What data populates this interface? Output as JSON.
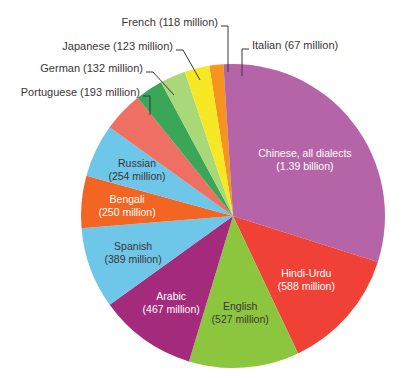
{
  "chart_data": {
    "type": "pie",
    "title": "",
    "subtitle": "",
    "xlabel": "",
    "ylabel": "",
    "legend_position": "none",
    "grid": false,
    "unit": "millions of speakers",
    "categories": [
      "Chinese, all dialects",
      "Hindi-Urdu",
      "English",
      "Arabic",
      "Spanish",
      "Bengali",
      "Russian",
      "Portuguese",
      "German",
      "Japanese",
      "French",
      "Italian"
    ],
    "values": [
      1390,
      588,
      527,
      467,
      389,
      250,
      254,
      193,
      132,
      123,
      118,
      67
    ],
    "value_labels": [
      "(1.39 billion)",
      "(588 million)",
      "(527 million)",
      "(467 million)",
      "(389 million)",
      "(250 million)",
      "(254 million)",
      "(193 million)",
      "(132 million)",
      "(123 million)",
      "(118 million)",
      "(67 million)"
    ],
    "colors": [
      "#b565a7",
      "#ef4136",
      "#8cc63f",
      "#a42a7b",
      "#6ec6e8",
      "#f26522",
      "#6ec6e8",
      "#ef6f63",
      "#3aa657",
      "#a8d878",
      "#f7e825",
      "#f7941e"
    ]
  },
  "slices": [
    {
      "name": "Chinese, all dialects",
      "value": 1390,
      "label_line1": "Chinese, all dialects",
      "label_line2": "(1.39 billion)",
      "color": "#b565a7",
      "label_placement": "inside",
      "label_color": "light"
    },
    {
      "name": "Hindi-Urdu",
      "value": 588,
      "label_line1": "Hindi-Urdu",
      "label_line2": "(588 million)",
      "color": "#ef4136",
      "label_placement": "inside",
      "label_color": "light"
    },
    {
      "name": "English",
      "value": 527,
      "label_line1": "English",
      "label_line2": "(527 million)",
      "color": "#8cc63f",
      "label_placement": "inside",
      "label_color": "dark"
    },
    {
      "name": "Arabic",
      "value": 467,
      "label_line1": "Arabic",
      "label_line2": "(467 million)",
      "color": "#a42a7b",
      "label_placement": "inside",
      "label_color": "light"
    },
    {
      "name": "Spanish",
      "value": 389,
      "label_line1": "Spanish",
      "label_line2": "(389 million)",
      "color": "#6ec6e8",
      "label_placement": "inside",
      "label_color": "dark"
    },
    {
      "name": "Bengali",
      "value": 250,
      "label_line1": "Bengali",
      "label_line2": "(250 million)",
      "color": "#f26522",
      "label_placement": "inside",
      "label_color": "light"
    },
    {
      "name": "Russian",
      "value": 254,
      "label_line1": "Russian",
      "label_line2": "(254 million)",
      "color": "#6ec6e8",
      "label_placement": "inside",
      "label_color": "dark"
    },
    {
      "name": "Portuguese",
      "value": 193,
      "label_line1": "Portuguese (193 million)",
      "label_line2": "",
      "color": "#ef6f63",
      "label_placement": "callout",
      "label_color": "dark"
    },
    {
      "name": "German",
      "value": 132,
      "label_line1": "German (132 million)",
      "label_line2": "",
      "color": "#3aa657",
      "label_placement": "callout",
      "label_color": "dark"
    },
    {
      "name": "Japanese",
      "value": 123,
      "label_line1": "Japanese (123 million)",
      "label_line2": "",
      "color": "#a8d878",
      "label_placement": "callout",
      "label_color": "dark"
    },
    {
      "name": "French",
      "value": 118,
      "label_line1": "French (118 million)",
      "label_line2": "",
      "color": "#f7e825",
      "label_placement": "callout",
      "label_color": "dark"
    },
    {
      "name": "Italian",
      "value": 67,
      "label_line1": "Italian (67 million)",
      "label_line2": "",
      "color": "#f7941e",
      "label_placement": "callout",
      "label_color": "dark"
    }
  ],
  "callouts": {
    "french": "French (118 million)",
    "japanese": "Japanese (123 million)",
    "german": "German (132 million)",
    "portuguese": "Portuguese (193 million)",
    "italian": "Italian (67 million)"
  },
  "inside_labels": {
    "chinese_1": "Chinese, all dialects",
    "chinese_2": "(1.39 billion)",
    "hindi_1": "Hindi-Urdu",
    "hindi_2": "(588 million)",
    "english_1": "English",
    "english_2": "(527 million)",
    "arabic_1": "Arabic",
    "arabic_2": "(467 million)",
    "spanish_1": "Spanish",
    "spanish_2": "(389 million)",
    "bengali_1": "Bengali",
    "bengali_2": "(250 million)",
    "russian_1": "Russian",
    "russian_2": "(254 million)"
  }
}
